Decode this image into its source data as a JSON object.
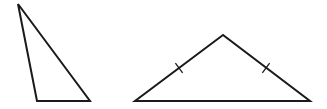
{
  "figure": {
    "stroke_color": "#1a1a1a",
    "background_color": "#ffffff",
    "stroke_width": 2
  },
  "shapes": [
    {
      "id": "scalene-triangle",
      "type": "triangle",
      "classification": "scalene",
      "vertices": [
        [
          18,
          4
        ],
        [
          37,
          101
        ],
        [
          90,
          101
        ]
      ],
      "tick_marks": []
    },
    {
      "id": "isosceles-triangle",
      "type": "triangle",
      "classification": "isosceles",
      "vertices": [
        [
          223,
          35
        ],
        [
          135,
          101
        ],
        [
          310,
          101
        ]
      ],
      "tick_marks": [
        {
          "side": "left",
          "center": [
            179,
            68
          ]
        },
        {
          "side": "right",
          "center": [
            266,
            68
          ]
        }
      ]
    }
  ]
}
